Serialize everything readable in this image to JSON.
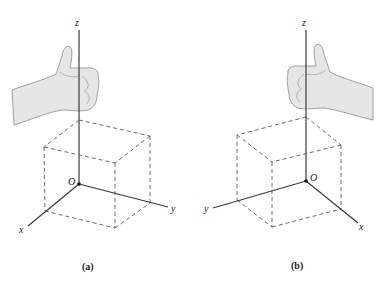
{
  "figure": {
    "panels": [
      {
        "id": "a",
        "caption": "(a)",
        "handedness": "right-hand",
        "axes": {
          "z": "z",
          "y": "y",
          "x": "x",
          "origin": "O"
        }
      },
      {
        "id": "b",
        "caption": "(b)",
        "handedness": "left-hand",
        "axes": {
          "z": "z",
          "y": "y",
          "x": "x",
          "origin": "O"
        }
      }
    ],
    "colors": {
      "line": "#3a3a3a",
      "dashed": "#5a5a5a",
      "hand_fill": "#e6e6e6"
    }
  }
}
